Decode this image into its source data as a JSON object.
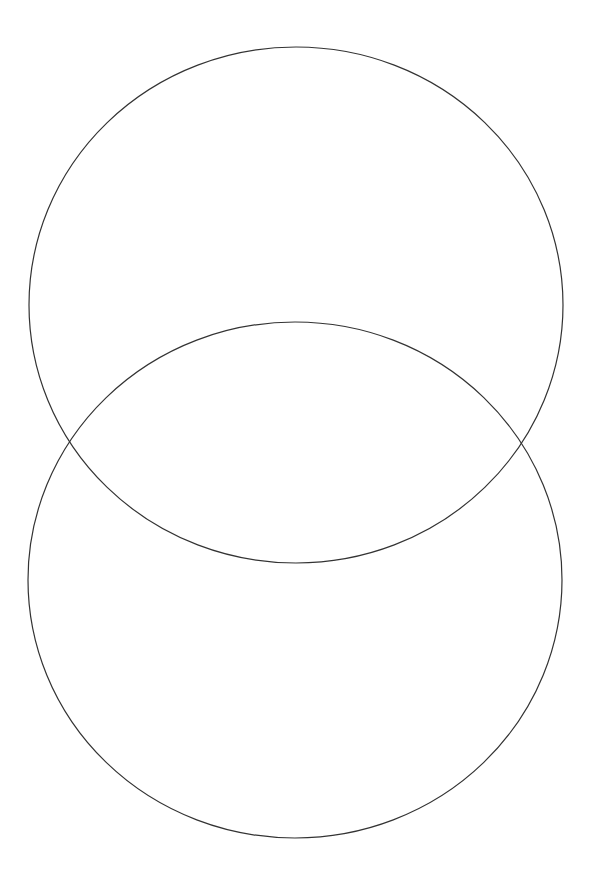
{
  "canvas": {
    "width": 591,
    "height": 895,
    "background": "#ffffff"
  },
  "diagram": {
    "type": "venn",
    "stroke_color": "#333333",
    "stroke_width": 1.2,
    "fill": "none",
    "shapes": [
      {
        "id": "top-circle",
        "cx": 296,
        "cy": 305,
        "rx": 267,
        "ry": 258
      },
      {
        "id": "bottom-circle",
        "cx": 295,
        "cy": 580,
        "rx": 267,
        "ry": 258
      }
    ],
    "intersections": [
      {
        "x": 69,
        "y": 440
      },
      {
        "x": 522,
        "y": 442
      }
    ],
    "labels": []
  }
}
